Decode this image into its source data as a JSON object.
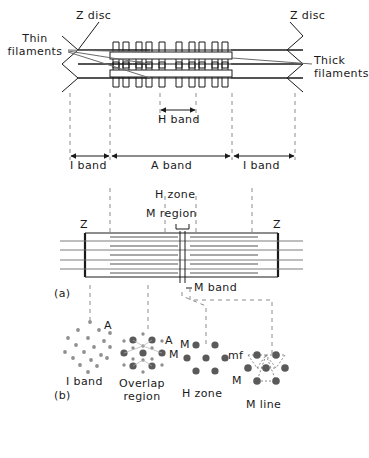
{
  "figure": {
    "caption_a": "(a)",
    "caption_b": "(b)"
  },
  "panel_a_top": {
    "labels": {
      "z_disc_left": "Z disc",
      "z_disc_right": "Z disc",
      "thin_filaments": "Thin\nfilaments",
      "thick_filaments": "Thick\nfilaments",
      "h_band": "H band",
      "i_band_left": "I band",
      "a_band": "A band",
      "i_band_right": "I band"
    }
  },
  "panel_a_mid": {
    "labels": {
      "h_zone": "H zone",
      "m_region": "M region",
      "z_left": "Z",
      "z_right": "Z",
      "m_band": "M band"
    }
  },
  "panel_b": {
    "sections": [
      {
        "name": "i-band-cross-section",
        "caption": "I band",
        "markers": [
          {
            "text": "A"
          }
        ],
        "thick_count": 0,
        "thin_count": 19
      },
      {
        "name": "overlap-region-cross-section",
        "caption": "Overlap\nregion",
        "markers": [
          {
            "text": "A"
          },
          {
            "text": "M"
          }
        ],
        "thick_count": 7,
        "thin_count": 12
      },
      {
        "name": "h-zone-cross-section",
        "caption": "H zone",
        "markers": [
          {
            "text": "M"
          }
        ],
        "thick_count": 7,
        "thin_count": 0
      },
      {
        "name": "m-line-cross-section",
        "caption": "M line",
        "markers": [
          {
            "text": "mf"
          },
          {
            "text": "M"
          }
        ],
        "thick_count": 7,
        "thin_count": 0
      }
    ]
  },
  "colors": {
    "ink": "#1a1a1a",
    "filament_gray": "#9a9a9a",
    "dot_thick": "#5a5a5a",
    "dot_thin": "#8f8f8f",
    "dash": "#8c8c8c"
  }
}
